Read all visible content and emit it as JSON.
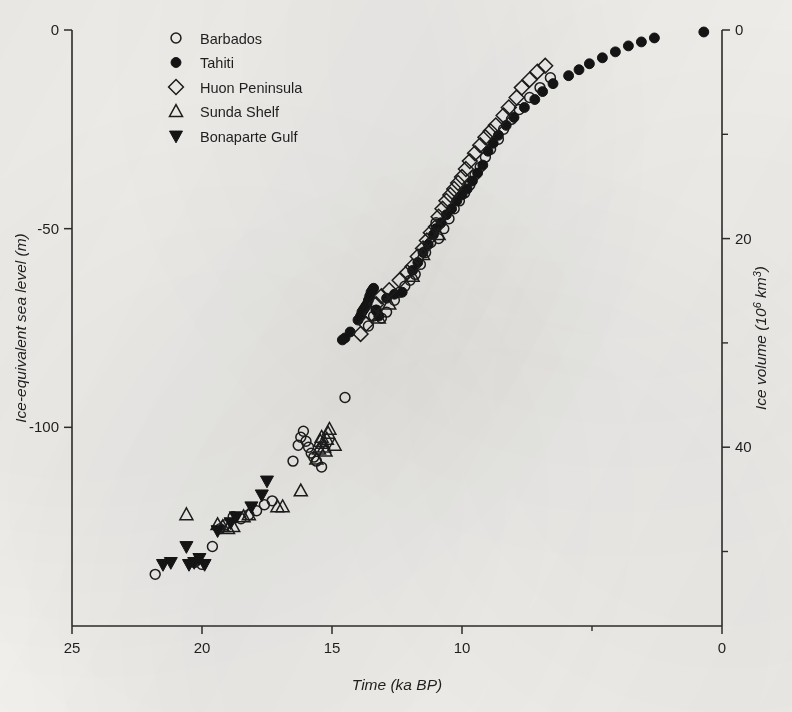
{
  "figure": {
    "background_color": "#f4f3f0",
    "ink_color": "#1a1a1a"
  },
  "axes": {
    "x": {
      "title": "Time (ka BP)",
      "tick_labels": [
        "25",
        "20",
        "15",
        "10",
        "0"
      ],
      "tick_values": [
        25,
        20,
        15,
        10,
        0
      ],
      "minor_tick_values": [
        5
      ],
      "range": [
        25,
        0
      ],
      "reversed": true
    },
    "y_left": {
      "title": "Ice-equivalent sea level (m)",
      "tick_labels": [
        "0",
        "-50",
        "-100"
      ],
      "tick_values": [
        0,
        -50,
        -100
      ],
      "range": [
        -150,
        0
      ]
    },
    "y_right": {
      "title_main": "Ice volume (10",
      "title_sup": "6",
      "title_tail": " km",
      "title_sup2": "3",
      "title_close": ")",
      "title_plain": "Ice volume (106 km3)",
      "tick_labels": [
        "0",
        "20",
        "40"
      ],
      "tick_values": [
        0,
        20,
        40
      ],
      "minor_tick_values": [
        10,
        30,
        50
      ]
    }
  },
  "legend": {
    "items": [
      {
        "label": "Barbados",
        "marker": "circle-open",
        "key": "barbados"
      },
      {
        "label": "Tahiti",
        "marker": "circle-filled",
        "key": "tahiti"
      },
      {
        "label": "Huon Peninsula",
        "marker": "diamond-open",
        "key": "huon"
      },
      {
        "label": "Sunda Shelf",
        "marker": "triangle-up-open",
        "key": "sunda"
      },
      {
        "label": "Bonaparte Gulf",
        "marker": "triangle-down-filled",
        "key": "bonaparte"
      }
    ]
  },
  "chart_data": {
    "type": "scatter",
    "title": "",
    "xlabel": "Time (ka BP)",
    "ylabel": "Ice-equivalent sea level (m)",
    "y2label": "Ice volume (10^6 km^3)",
    "xlim": [
      25,
      0
    ],
    "ylim": [
      -150,
      0
    ],
    "y2lim": [
      55,
      0
    ],
    "x_reversed": true,
    "grid": false,
    "legend_position": "top-left",
    "series": [
      {
        "name": "Barbados",
        "marker": "circle-open",
        "points": [
          [
            21.8,
            -137.0
          ],
          [
            20.3,
            -134.0
          ],
          [
            20.0,
            -134.5
          ],
          [
            19.6,
            -130.0
          ],
          [
            19.3,
            -125.5
          ],
          [
            19.1,
            -124.5
          ],
          [
            18.8,
            -122.5
          ],
          [
            18.5,
            -123.0
          ],
          [
            18.2,
            -122.0
          ],
          [
            17.9,
            -121.0
          ],
          [
            17.6,
            -119.5
          ],
          [
            17.3,
            -118.5
          ],
          [
            16.5,
            -108.5
          ],
          [
            16.3,
            -104.5
          ],
          [
            16.2,
            -102.5
          ],
          [
            16.1,
            -101.0
          ],
          [
            16.0,
            -103.5
          ],
          [
            15.9,
            -105.0
          ],
          [
            15.8,
            -106.5
          ],
          [
            15.7,
            -107.5
          ],
          [
            15.6,
            -108.5
          ],
          [
            15.4,
            -110.0
          ],
          [
            14.5,
            -92.5
          ],
          [
            13.6,
            -74.5
          ],
          [
            13.4,
            -72.0
          ],
          [
            13.3,
            -70.5
          ],
          [
            13.1,
            -72.5
          ],
          [
            12.9,
            -71.0
          ],
          [
            12.6,
            -68.0
          ],
          [
            12.4,
            -66.0
          ],
          [
            12.2,
            -64.5
          ],
          [
            12.0,
            -63.0
          ],
          [
            11.8,
            -61.5
          ],
          [
            11.6,
            -59.0
          ],
          [
            11.4,
            -56.0
          ],
          [
            11.2,
            -53.5
          ],
          [
            11.0,
            -48.5
          ],
          [
            10.9,
            -52.5
          ],
          [
            10.7,
            -50.0
          ],
          [
            10.5,
            -47.5
          ],
          [
            10.3,
            -45.0
          ],
          [
            10.1,
            -43.0
          ],
          [
            9.9,
            -41.0
          ],
          [
            9.7,
            -39.0
          ],
          [
            9.5,
            -36.5
          ],
          [
            9.3,
            -34.5
          ],
          [
            9.1,
            -32.0
          ],
          [
            8.9,
            -30.0
          ],
          [
            8.6,
            -27.5
          ],
          [
            8.4,
            -25.0
          ],
          [
            8.1,
            -22.5
          ],
          [
            7.8,
            -20.0
          ],
          [
            7.4,
            -17.0
          ],
          [
            7.0,
            -14.5
          ],
          [
            6.6,
            -12.0
          ]
        ]
      },
      {
        "name": "Tahiti",
        "marker": "circle-filled",
        "points": [
          [
            14.0,
            -73.0
          ],
          [
            13.9,
            -72.0
          ],
          [
            13.85,
            -71.0
          ],
          [
            13.8,
            -70.5
          ],
          [
            13.75,
            -70.0
          ],
          [
            13.7,
            -69.5
          ],
          [
            13.65,
            -69.0
          ],
          [
            13.6,
            -68.0
          ],
          [
            13.55,
            -67.0
          ],
          [
            13.5,
            -66.0
          ],
          [
            13.45,
            -65.5
          ],
          [
            13.4,
            -65.0
          ],
          [
            13.3,
            -70.5
          ],
          [
            13.2,
            -72.0
          ],
          [
            14.3,
            -76.0
          ],
          [
            14.5,
            -77.5
          ],
          [
            14.6,
            -78.0
          ],
          [
            12.9,
            -67.5
          ],
          [
            12.6,
            -66.5
          ],
          [
            12.3,
            -66.0
          ],
          [
            11.9,
            -60.5
          ],
          [
            11.7,
            -58.5
          ],
          [
            11.5,
            -56.0
          ],
          [
            11.3,
            -54.0
          ],
          [
            11.1,
            -51.5
          ],
          [
            11.0,
            -50.0
          ],
          [
            10.8,
            -48.5
          ],
          [
            10.6,
            -46.5
          ],
          [
            10.4,
            -45.0
          ],
          [
            10.2,
            -43.0
          ],
          [
            10.0,
            -41.5
          ],
          [
            9.8,
            -40.0
          ],
          [
            9.6,
            -38.0
          ],
          [
            9.4,
            -36.0
          ],
          [
            9.2,
            -34.0
          ],
          [
            9.0,
            -30.5
          ],
          [
            8.8,
            -28.5
          ],
          [
            8.6,
            -26.5
          ],
          [
            8.3,
            -24.0
          ],
          [
            8.0,
            -22.0
          ],
          [
            7.6,
            -19.5
          ],
          [
            7.2,
            -17.5
          ],
          [
            6.9,
            -15.5
          ],
          [
            6.5,
            -13.5
          ],
          [
            5.9,
            -11.5
          ],
          [
            5.5,
            -10.0
          ],
          [
            5.1,
            -8.5
          ],
          [
            4.6,
            -7.0
          ],
          [
            4.1,
            -5.5
          ],
          [
            3.6,
            -4.0
          ],
          [
            3.1,
            -3.0
          ],
          [
            2.6,
            -2.0
          ],
          [
            0.7,
            -0.5
          ]
        ]
      },
      {
        "name": "Huon Peninsula",
        "marker": "diamond-open",
        "points": [
          [
            13.7,
            -74.0
          ],
          [
            13.5,
            -71.5
          ],
          [
            13.3,
            -69.0
          ],
          [
            13.1,
            -67.0
          ],
          [
            12.8,
            -65.5
          ],
          [
            13.9,
            -76.5
          ],
          [
            12.4,
            -63.0
          ],
          [
            12.1,
            -61.0
          ],
          [
            11.9,
            -59.5
          ],
          [
            11.7,
            -57.0
          ],
          [
            11.5,
            -55.0
          ],
          [
            11.35,
            -53.0
          ],
          [
            11.2,
            -51.0
          ],
          [
            11.0,
            -49.5
          ],
          [
            10.9,
            -47.0
          ],
          [
            10.75,
            -45.0
          ],
          [
            10.6,
            -43.0
          ],
          [
            10.45,
            -41.5
          ],
          [
            10.3,
            -40.0
          ],
          [
            10.15,
            -38.5
          ],
          [
            10.0,
            -37.0
          ],
          [
            9.85,
            -35.0
          ],
          [
            9.7,
            -33.0
          ],
          [
            9.5,
            -31.0
          ],
          [
            9.3,
            -29.0
          ],
          [
            9.1,
            -27.0
          ],
          [
            8.9,
            -25.5
          ],
          [
            8.7,
            -24.0
          ],
          [
            8.4,
            -21.5
          ],
          [
            8.2,
            -19.5
          ],
          [
            7.9,
            -17.0
          ],
          [
            7.7,
            -14.5
          ],
          [
            7.4,
            -12.5
          ],
          [
            7.1,
            -10.5
          ],
          [
            6.8,
            -9.0
          ]
        ]
      },
      {
        "name": "Sunda Shelf",
        "marker": "triangle-up-open",
        "points": [
          [
            20.6,
            -122.0
          ],
          [
            19.4,
            -124.5
          ],
          [
            19.2,
            -125.0
          ],
          [
            19.0,
            -125.5
          ],
          [
            18.8,
            -125.0
          ],
          [
            18.4,
            -122.5
          ],
          [
            18.2,
            -122.0
          ],
          [
            17.1,
            -120.0
          ],
          [
            16.9,
            -120.0
          ],
          [
            16.2,
            -116.0
          ],
          [
            15.6,
            -108.0
          ],
          [
            15.5,
            -105.5
          ],
          [
            15.45,
            -103.5
          ],
          [
            15.4,
            -102.5
          ],
          [
            15.35,
            -104.0
          ],
          [
            15.3,
            -105.0
          ],
          [
            15.25,
            -106.0
          ],
          [
            15.2,
            -103.0
          ],
          [
            15.15,
            -101.5
          ],
          [
            15.1,
            -100.5
          ],
          [
            14.9,
            -104.5
          ],
          [
            13.2,
            -72.5
          ],
          [
            12.8,
            -69.0
          ],
          [
            11.9,
            -62.0
          ],
          [
            11.5,
            -56.5
          ],
          [
            10.9,
            -51.5
          ]
        ]
      },
      {
        "name": "Bonaparte Gulf",
        "marker": "triangle-down-filled",
        "points": [
          [
            21.5,
            -134.5
          ],
          [
            21.2,
            -134.0
          ],
          [
            20.5,
            -134.5
          ],
          [
            20.3,
            -134.0
          ],
          [
            20.1,
            -133.0
          ],
          [
            20.6,
            -130.0
          ],
          [
            19.9,
            -134.5
          ],
          [
            19.4,
            -126.0
          ],
          [
            18.9,
            -124.0
          ],
          [
            18.7,
            -122.5
          ],
          [
            18.1,
            -120.0
          ],
          [
            17.7,
            -117.0
          ],
          [
            17.5,
            -113.5
          ]
        ]
      }
    ]
  }
}
